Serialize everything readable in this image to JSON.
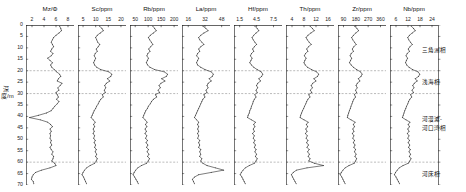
{
  "figure": {
    "depth_axis_label": "深度/m",
    "depth_ticks": [
      0,
      5,
      10,
      15,
      20,
      25,
      30,
      35,
      40,
      45,
      50,
      55,
      60,
      65,
      70
    ],
    "depth_range": [
      0,
      70
    ],
    "facies_boundaries": [
      20,
      30,
      60
    ],
    "facies_labels": [
      {
        "text": "三角洲相",
        "depth": 11
      },
      {
        "text": "浅海相",
        "depth": 25
      },
      {
        "text": "河漫滩-",
        "depth": 41
      },
      {
        "text": "河口湾相",
        "depth": 45
      },
      {
        "text": "河床相",
        "depth": 65
      }
    ]
  },
  "chart_data": [
    {
      "type": "line",
      "title": "Mz/Φ",
      "xlabel": "Mz/Φ",
      "ylabel": "深度/m",
      "xticks": [
        2,
        4,
        6,
        8
      ],
      "xlim": [
        1,
        9
      ],
      "ylim": [
        0,
        70
      ],
      "grid": false,
      "orientation": "depth-profile",
      "depths": [
        0.5,
        1.5,
        2.5,
        3.5,
        4.5,
        5.5,
        6.5,
        7.5,
        8.5,
        9.5,
        10.5,
        11.5,
        12.5,
        13.5,
        14.5,
        15.5,
        16.5,
        17.5,
        18.5,
        19.5,
        20.5,
        21.5,
        22.5,
        23.5,
        24.5,
        25.5,
        26.5,
        27.5,
        28.5,
        29.5,
        30.5,
        31.5,
        32.5,
        33.5,
        34.5,
        35.5,
        36.5,
        37.5,
        38.5,
        39.5,
        40.5,
        41.5,
        42.5,
        43.5,
        44.5,
        45.5,
        46.5,
        47.5,
        48.5,
        49.5,
        50.5,
        51.5,
        52.5,
        53.5,
        54.5,
        55.5,
        56.5,
        57.5,
        58.5,
        59.5,
        60.5,
        61.5,
        62.5,
        63.5,
        64.5,
        65.5,
        66.5,
        67.5,
        68.5,
        69.5
      ],
      "values": [
        6.6,
        6.8,
        6.9,
        6.5,
        6.0,
        5.6,
        5.4,
        5.2,
        5.4,
        5.6,
        5.3,
        5.1,
        5.5,
        5.2,
        4.6,
        5.0,
        5.4,
        5.1,
        5.3,
        5.7,
        6.1,
        6.6,
        6.8,
        6.4,
        6.2,
        7.0,
        6.7,
        6.3,
        6.5,
        6.0,
        6.2,
        6.4,
        6.1,
        6.5,
        6.2,
        5.8,
        5.5,
        5.2,
        4.4,
        3.1,
        1.6,
        3.4,
        4.6,
        5.1,
        5.4,
        5.0,
        5.2,
        5.0,
        5.1,
        5.0,
        5.2,
        5.1,
        5.3,
        5.0,
        5.2,
        5.5,
        5.3,
        5.6,
        5.5,
        5.3,
        5.8,
        6.0,
        5.0,
        3.6,
        2.6,
        2.2,
        2.0,
        1.9,
        2.2,
        2.3
      ]
    },
    {
      "type": "line",
      "title": "Sc/ppm",
      "xlabel": "Sc/ppm",
      "xticks": [
        5,
        10,
        15,
        20
      ],
      "xlim": [
        3,
        22
      ],
      "ylim": [
        0,
        70
      ],
      "grid": false,
      "orientation": "depth-profile",
      "depths": [
        0.5,
        1.5,
        2.5,
        3.5,
        4.5,
        5.5,
        6.5,
        7.5,
        8.5,
        9.5,
        10.5,
        11.5,
        12.5,
        13.5,
        14.5,
        15.5,
        16.5,
        17.5,
        18.5,
        19.5,
        20.5,
        21.5,
        22.5,
        23.5,
        24.5,
        25.5,
        26.5,
        27.5,
        28.5,
        29.5,
        30.5,
        31.5,
        32.5,
        33.5,
        34.5,
        35.5,
        36.5,
        37.5,
        38.5,
        39.5,
        40.5,
        41.5,
        42.5,
        43.5,
        44.5,
        45.5,
        46.5,
        47.5,
        48.5,
        49.5,
        50.5,
        51.5,
        52.5,
        53.5,
        54.5,
        55.5,
        56.5,
        57.5,
        58.5,
        59.5,
        60.5,
        61.5,
        62.5,
        63.5,
        64.5,
        65.5,
        66.5,
        67.5,
        68.5,
        69.5
      ],
      "values": [
        11.5,
        12.5,
        13.0,
        11.8,
        10.6,
        10.0,
        10.4,
        10.8,
        11.6,
        11.0,
        10.2,
        10.6,
        9.8,
        9.4,
        10.0,
        9.6,
        9.2,
        9.6,
        10.4,
        12.0,
        15.2,
        16.4,
        16.0,
        14.6,
        15.6,
        14.2,
        13.6,
        14.0,
        13.4,
        13.8,
        12.6,
        13.0,
        12.0,
        11.4,
        11.0,
        10.4,
        10.0,
        9.4,
        9.0,
        8.6,
        8.2,
        9.0,
        9.8,
        9.2,
        9.6,
        9.0,
        9.4,
        9.0,
        9.6,
        9.2,
        9.8,
        9.4,
        10.0,
        9.6,
        10.2,
        9.8,
        10.4,
        10.0,
        10.6,
        10.2,
        9.6,
        7.8,
        6.4,
        5.6,
        5.0,
        4.6,
        5.2,
        5.6,
        6.0,
        6.4
      ]
    },
    {
      "type": "line",
      "title": "Rb/ppm",
      "xlabel": "Rb/ppm",
      "xticks": [
        50,
        100,
        150,
        200
      ],
      "xlim": [
        30,
        215
      ],
      "ylim": [
        0,
        70
      ],
      "grid": false,
      "orientation": "depth-profile",
      "depths": [
        0.5,
        1.5,
        2.5,
        3.5,
        4.5,
        5.5,
        6.5,
        7.5,
        8.5,
        9.5,
        10.5,
        11.5,
        12.5,
        13.5,
        14.5,
        15.5,
        16.5,
        17.5,
        18.5,
        19.5,
        20.5,
        21.5,
        22.5,
        23.5,
        24.5,
        25.5,
        26.5,
        27.5,
        28.5,
        29.5,
        30.5,
        31.5,
        32.5,
        33.5,
        34.5,
        35.5,
        36.5,
        37.5,
        38.5,
        39.5,
        40.5,
        41.5,
        42.5,
        43.5,
        44.5,
        45.5,
        46.5,
        47.5,
        48.5,
        49.5,
        50.5,
        51.5,
        52.5,
        53.5,
        54.5,
        55.5,
        56.5,
        57.5,
        58.5,
        59.5,
        60.5,
        61.5,
        62.5,
        63.5,
        64.5,
        65.5,
        66.5,
        67.5,
        68.5,
        69.5
      ],
      "values": [
        118,
        125,
        131,
        120,
        108,
        101,
        106,
        112,
        118,
        110,
        102,
        107,
        99,
        95,
        101,
        97,
        93,
        98,
        107,
        125,
        162,
        175,
        170,
        152,
        165,
        149,
        142,
        147,
        138,
        144,
        128,
        133,
        120,
        113,
        108,
        101,
        97,
        91,
        87,
        83,
        80,
        88,
        96,
        90,
        95,
        88,
        93,
        88,
        95,
        90,
        97,
        92,
        99,
        94,
        101,
        96,
        103,
        98,
        105,
        100,
        94,
        74,
        60,
        52,
        46,
        42,
        48,
        53,
        58,
        62
      ]
    },
    {
      "type": "line",
      "title": "La/ppm",
      "xlabel": "La/ppm",
      "xticks": [
        16,
        32,
        48
      ],
      "xlim": [
        10,
        56
      ],
      "ylim": [
        0,
        70
      ],
      "grid": false,
      "orientation": "depth-profile",
      "depths": [
        0.5,
        1.5,
        2.5,
        3.5,
        4.5,
        5.5,
        6.5,
        7.5,
        8.5,
        9.5,
        10.5,
        11.5,
        12.5,
        13.5,
        14.5,
        15.5,
        16.5,
        17.5,
        18.5,
        19.5,
        20.5,
        21.5,
        22.5,
        23.5,
        24.5,
        25.5,
        26.5,
        27.5,
        28.5,
        29.5,
        30.5,
        31.5,
        32.5,
        33.5,
        34.5,
        35.5,
        36.5,
        37.5,
        38.5,
        39.5,
        40.5,
        41.5,
        42.5,
        43.5,
        44.5,
        45.5,
        46.5,
        47.5,
        48.5,
        49.5,
        50.5,
        51.5,
        52.5,
        53.5,
        54.5,
        55.5,
        56.5,
        57.5,
        58.5,
        59.5,
        60.5,
        61.5,
        62.5,
        63.5,
        64.5,
        65.5,
        66.5,
        67.5,
        68.5,
        69.5
      ],
      "values": [
        30,
        33,
        35,
        31,
        28,
        26,
        27,
        29,
        31,
        28,
        26,
        27,
        25,
        24,
        26,
        25,
        24,
        25,
        28,
        32,
        38,
        40,
        39,
        36,
        38,
        35,
        34,
        35,
        33,
        34,
        31,
        32,
        30,
        29,
        28,
        27,
        26,
        25,
        24,
        23,
        22,
        24,
        26,
        25,
        26,
        25,
        26,
        25,
        26,
        25,
        27,
        26,
        27,
        26,
        28,
        27,
        28,
        27,
        29,
        28,
        30,
        34,
        42,
        50,
        38,
        26,
        22,
        20,
        21,
        22
      ]
    },
    {
      "type": "line",
      "title": "Hf/ppm",
      "xlabel": "Hf/ppm",
      "xticks": [
        1.5,
        4.5,
        7.5
      ],
      "xlim": [
        0.5,
        9
      ],
      "ylim": [
        0,
        70
      ],
      "grid": false,
      "orientation": "depth-profile",
      "depths": [
        0.5,
        1.5,
        2.5,
        3.5,
        4.5,
        5.5,
        6.5,
        7.5,
        8.5,
        9.5,
        10.5,
        11.5,
        12.5,
        13.5,
        14.5,
        15.5,
        16.5,
        17.5,
        18.5,
        19.5,
        20.5,
        21.5,
        22.5,
        23.5,
        24.5,
        25.5,
        26.5,
        27.5,
        28.5,
        29.5,
        30.5,
        31.5,
        32.5,
        33.5,
        34.5,
        35.5,
        36.5,
        37.5,
        38.5,
        39.5,
        40.5,
        41.5,
        42.5,
        43.5,
        44.5,
        45.5,
        46.5,
        47.5,
        48.5,
        49.5,
        50.5,
        51.5,
        52.5,
        53.5,
        54.5,
        55.5,
        56.5,
        57.5,
        58.5,
        59.5,
        60.5,
        61.5,
        62.5,
        63.5,
        64.5,
        65.5,
        66.5,
        67.5,
        68.5,
        69.5
      ],
      "values": [
        4.2,
        4.6,
        4.9,
        4.4,
        4.0,
        3.7,
        3.9,
        4.2,
        4.5,
        4.1,
        3.8,
        4.0,
        3.6,
        3.4,
        3.7,
        3.5,
        3.3,
        3.6,
        4.0,
        4.6,
        5.3,
        5.6,
        5.4,
        4.9,
        5.2,
        4.7,
        4.5,
        4.7,
        4.4,
        4.6,
        4.2,
        4.4,
        4.1,
        3.9,
        3.8,
        3.6,
        3.5,
        3.3,
        3.2,
        3.0,
        2.9,
        3.6,
        4.3,
        4.0,
        4.2,
        3.9,
        4.1,
        3.8,
        4.1,
        3.9,
        4.2,
        4.0,
        4.3,
        4.1,
        4.4,
        4.2,
        4.5,
        4.3,
        4.6,
        4.4,
        4.1,
        3.2,
        2.5,
        2.1,
        1.8,
        1.6,
        1.9,
        2.1,
        2.3,
        2.5
      ]
    },
    {
      "type": "line",
      "title": "Th/ppm",
      "xlabel": "Th/ppm",
      "xticks": [
        4,
        8,
        12,
        16
      ],
      "xlim": [
        2,
        18
      ],
      "ylim": [
        0,
        70
      ],
      "grid": false,
      "orientation": "depth-profile",
      "depths": [
        0.5,
        1.5,
        2.5,
        3.5,
        4.5,
        5.5,
        6.5,
        7.5,
        8.5,
        9.5,
        10.5,
        11.5,
        12.5,
        13.5,
        14.5,
        15.5,
        16.5,
        17.5,
        18.5,
        19.5,
        20.5,
        21.5,
        22.5,
        23.5,
        24.5,
        25.5,
        26.5,
        27.5,
        28.5,
        29.5,
        30.5,
        31.5,
        32.5,
        33.5,
        34.5,
        35.5,
        36.5,
        37.5,
        38.5,
        39.5,
        40.5,
        41.5,
        42.5,
        43.5,
        44.5,
        45.5,
        46.5,
        47.5,
        48.5,
        49.5,
        50.5,
        51.5,
        52.5,
        53.5,
        54.5,
        55.5,
        56.5,
        57.5,
        58.5,
        59.5,
        60.5,
        61.5,
        62.5,
        63.5,
        64.5,
        65.5,
        66.5,
        67.5,
        68.5,
        69.5
      ],
      "values": [
        10.0,
        10.8,
        11.4,
        10.3,
        9.3,
        8.7,
        9.1,
        9.7,
        10.4,
        9.5,
        8.9,
        9.3,
        8.5,
        8.1,
        8.7,
        8.3,
        8.0,
        8.4,
        9.2,
        10.5,
        12.2,
        12.9,
        12.5,
        11.3,
        12.0,
        10.9,
        10.4,
        10.8,
        10.1,
        10.6,
        9.6,
        10.0,
        9.3,
        8.9,
        8.6,
        8.2,
        7.9,
        7.5,
        7.2,
        6.9,
        6.7,
        8.0,
        9.4,
        8.8,
        9.2,
        8.6,
        9.0,
        8.5,
        9.1,
        8.7,
        9.3,
        8.9,
        9.5,
        9.0,
        9.7,
        9.2,
        9.8,
        9.4,
        10.0,
        9.6,
        11.5,
        14.5,
        9.0,
        5.5,
        4.4,
        3.8,
        4.2,
        4.6,
        5.0,
        5.4
      ]
    },
    {
      "type": "line",
      "title": "Zr/ppm",
      "xlabel": "Zr/ppm",
      "xticks": [
        90,
        180,
        270,
        360
      ],
      "xlim": [
        50,
        400
      ],
      "ylim": [
        0,
        70
      ],
      "grid": false,
      "orientation": "depth-profile",
      "depths": [
        0.5,
        1.5,
        2.5,
        3.5,
        4.5,
        5.5,
        6.5,
        7.5,
        8.5,
        9.5,
        10.5,
        11.5,
        12.5,
        13.5,
        14.5,
        15.5,
        16.5,
        17.5,
        18.5,
        19.5,
        20.5,
        21.5,
        22.5,
        23.5,
        24.5,
        25.5,
        26.5,
        27.5,
        28.5,
        29.5,
        30.5,
        31.5,
        32.5,
        33.5,
        34.5,
        35.5,
        36.5,
        37.5,
        38.5,
        39.5,
        40.5,
        41.5,
        42.5,
        43.5,
        44.5,
        45.5,
        46.5,
        47.5,
        48.5,
        49.5,
        50.5,
        51.5,
        52.5,
        53.5,
        54.5,
        55.5,
        56.5,
        57.5,
        58.5,
        59.5,
        60.5,
        61.5,
        62.5,
        63.5,
        64.5,
        65.5,
        66.5,
        67.5,
        68.5,
        69.5
      ],
      "values": [
        172,
        188,
        200,
        180,
        162,
        150,
        158,
        170,
        182,
        166,
        154,
        162,
        146,
        138,
        150,
        142,
        134,
        146,
        162,
        186,
        214,
        226,
        218,
        198,
        210,
        190,
        182,
        190,
        178,
        186,
        170,
        178,
        165,
        158,
        152,
        145,
        140,
        133,
        128,
        122,
        118,
        145,
        175,
        162,
        170,
        158,
        166,
        155,
        166,
        158,
        170,
        162,
        174,
        166,
        178,
        170,
        182,
        174,
        186,
        178,
        168,
        130,
        102,
        86,
        74,
        66,
        78,
        86,
        94,
        102
      ]
    },
    {
      "type": "line",
      "title": "Nb/ppm",
      "xlabel": "Nb/ppm",
      "xticks": [
        6,
        12,
        18,
        24
      ],
      "xlim": [
        3,
        27
      ],
      "ylim": [
        0,
        70
      ],
      "grid": false,
      "orientation": "depth-profile",
      "depths": [
        0.5,
        1.5,
        2.5,
        3.5,
        4.5,
        5.5,
        6.5,
        7.5,
        8.5,
        9.5,
        10.5,
        11.5,
        12.5,
        13.5,
        14.5,
        15.5,
        16.5,
        17.5,
        18.5,
        19.5,
        20.5,
        21.5,
        22.5,
        23.5,
        24.5,
        25.5,
        26.5,
        27.5,
        28.5,
        29.5,
        30.5,
        31.5,
        32.5,
        33.5,
        34.5,
        35.5,
        36.5,
        37.5,
        38.5,
        39.5,
        40.5,
        41.5,
        42.5,
        43.5,
        44.5,
        45.5,
        46.5,
        47.5,
        48.5,
        49.5,
        50.5,
        51.5,
        52.5,
        53.5,
        54.5,
        55.5,
        56.5,
        57.5,
        58.5,
        59.5,
        60.5,
        61.5,
        62.5,
        63.5,
        64.5,
        65.5,
        66.5,
        67.5,
        68.5,
        69.5
      ],
      "values": [
        13.6,
        14.8,
        15.6,
        14.1,
        12.7,
        11.9,
        12.4,
        13.2,
        14.1,
        13.0,
        12.1,
        12.7,
        11.6,
        11.0,
        11.8,
        11.2,
        10.8,
        11.4,
        12.5,
        14.3,
        17.0,
        17.9,
        17.3,
        15.6,
        16.6,
        15.1,
        14.4,
        15.0,
        14.0,
        14.7,
        13.3,
        13.9,
        12.9,
        12.3,
        11.9,
        11.3,
        10.9,
        10.4,
        10.0,
        9.6,
        9.2,
        11.0,
        13.0,
        12.1,
        12.7,
        11.9,
        12.5,
        11.7,
        12.5,
        11.9,
        12.7,
        12.1,
        12.9,
        12.3,
        13.1,
        12.5,
        13.3,
        12.7,
        13.5,
        12.9,
        12.1,
        9.5,
        7.6,
        6.6,
        5.8,
        5.2,
        6.0,
        6.6,
        7.2,
        7.8
      ]
    }
  ]
}
